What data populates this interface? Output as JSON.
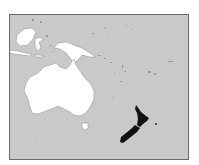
{
  "map": {
    "title": "Locator map of New Zealand",
    "region": "Oceania",
    "highlighted_country": "New Zealand",
    "colors": {
      "ocean": "#c9c9c9",
      "land": "#ffffff",
      "highlight": "#111111",
      "border": "#6a6a6a",
      "background": "#ffffff"
    },
    "features": [
      {
        "name": "Australia",
        "role": "context"
      },
      {
        "name": "Tasmania",
        "role": "context"
      },
      {
        "name": "New Guinea",
        "role": "context"
      },
      {
        "name": "Borneo",
        "role": "context"
      },
      {
        "name": "Sulawesi",
        "role": "context"
      },
      {
        "name": "Java",
        "role": "context"
      },
      {
        "name": "New Zealand North Island",
        "role": "highlight"
      },
      {
        "name": "New Zealand South Island",
        "role": "highlight"
      },
      {
        "name": "Pacific Islands",
        "role": "context"
      }
    ]
  }
}
